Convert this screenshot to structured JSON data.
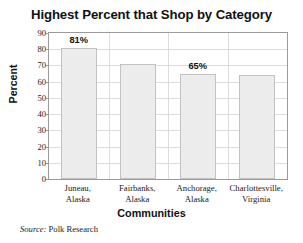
{
  "chart_data": {
    "type": "bar",
    "title": "Highest Percent that Shop by Category",
    "xlabel": "Communities",
    "ylabel": "Percent",
    "ylim": [
      0,
      90
    ],
    "ytick_step": 10,
    "yticks": [
      "90",
      "80",
      "70",
      "60",
      "50",
      "40",
      "30",
      "20",
      "10",
      "0"
    ],
    "grid": "both",
    "legend": "none",
    "categories": [
      {
        "line1": "Juneau,",
        "line2": "Alaska"
      },
      {
        "line1": "Fairbanks,",
        "line2": "Alaska"
      },
      {
        "line1": "Anchorage,",
        "line2": "Alaska"
      },
      {
        "line1": "Charlottesville,",
        "line2": "Virginia"
      }
    ],
    "values": [
      81,
      71,
      65,
      64
    ],
    "data_labels": [
      "81%",
      "",
      "65%",
      ""
    ],
    "bar_fill": "#ececec",
    "bar_border": "#c2c2c2",
    "axis_color": "#9a9a9a",
    "grid_color": "#dcdcdc",
    "text_color": "#111111"
  },
  "source": {
    "key": "Source:",
    "value": " Polk Research"
  }
}
